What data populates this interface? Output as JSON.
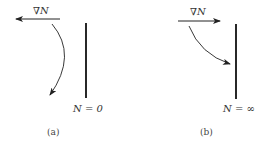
{
  "panels": [
    {
      "id": "a",
      "gradient_label": "∇N",
      "boundary_label": "N = 0",
      "caption": "(a)",
      "gradient_direction": "left"
    },
    {
      "id": "b",
      "gradient_label": "∇N",
      "boundary_label": "N = ∞",
      "caption": "(b)",
      "gradient_direction": "right"
    }
  ],
  "colors": {
    "stroke": "#222222",
    "background": "#ffffff"
  }
}
